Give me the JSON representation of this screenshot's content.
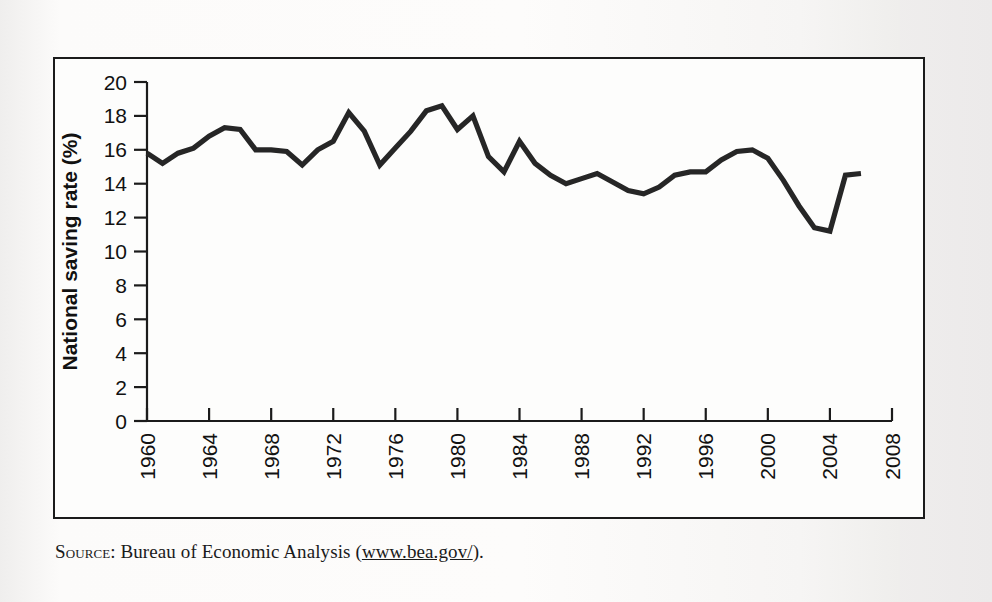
{
  "figure": {
    "source_prefix": "Source:",
    "source_body": " Bureau of Economic Analysis (",
    "source_url": "www.bea.gov/",
    "source_suffix": ")."
  },
  "chart_data": {
    "type": "line",
    "title": "",
    "xlabel": "Year",
    "ylabel": "National saving rate (%)",
    "xlim": [
      1960,
      2008
    ],
    "ylim": [
      0,
      20
    ],
    "ytick_step": 2,
    "xtick_step": 4,
    "grid": false,
    "legend": null,
    "line_color": "#262626",
    "ytick_labels": [
      "0",
      "2",
      "4",
      "6",
      "8",
      "10",
      "12",
      "14",
      "16",
      "18",
      "20"
    ],
    "ytick_values": [
      0,
      2,
      4,
      6,
      8,
      10,
      12,
      14,
      16,
      18,
      20
    ],
    "xtick_labels": [
      "1960",
      "1964",
      "1968",
      "1972",
      "1976",
      "1980",
      "1984",
      "1988",
      "1992",
      "1996",
      "2000",
      "2004",
      "2008"
    ],
    "xtick_values": [
      1960,
      1964,
      1968,
      1972,
      1976,
      1980,
      1984,
      1988,
      1992,
      1996,
      2000,
      2004,
      2008
    ],
    "x": [
      1960,
      1961,
      1962,
      1963,
      1964,
      1965,
      1966,
      1967,
      1968,
      1969,
      1970,
      1971,
      1972,
      1973,
      1974,
      1975,
      1976,
      1977,
      1978,
      1979,
      1980,
      1981,
      1982,
      1983,
      1984,
      1985,
      1986,
      1987,
      1988,
      1989,
      1990,
      1991,
      1992,
      1993,
      1994,
      1995,
      1996,
      1997,
      1998,
      1999,
      2000,
      2001,
      2002,
      2003,
      2004,
      2005,
      2006
    ],
    "values": [
      15.8,
      15.2,
      15.8,
      16.1,
      16.8,
      17.3,
      17.2,
      16.0,
      16.0,
      15.9,
      15.1,
      16.0,
      16.5,
      18.2,
      17.1,
      15.1,
      16.1,
      17.1,
      18.3,
      18.6,
      17.2,
      18.0,
      15.6,
      14.7,
      16.5,
      15.2,
      14.5,
      14.0,
      14.3,
      14.6,
      14.1,
      13.6,
      13.4,
      13.8,
      14.5,
      14.7,
      14.7,
      15.4,
      15.9,
      16.0,
      15.5,
      14.2,
      12.7,
      11.4,
      11.2,
      14.5,
      14.6
    ]
  }
}
